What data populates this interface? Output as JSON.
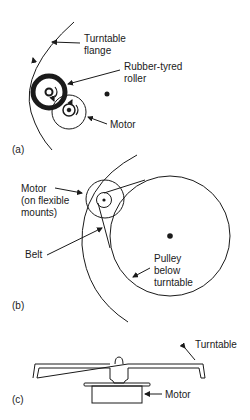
{
  "panels": {
    "a": {
      "tag": "(a)",
      "labels": {
        "flange_line1": "Turntable",
        "flange_line2": "flange",
        "roller_line1": "Rubber-tyred",
        "roller_line2": "roller",
        "motor": "Motor"
      }
    },
    "b": {
      "tag": "(b)",
      "labels": {
        "motor_line1": "Motor",
        "motor_line2": "(on flexible",
        "motor_line3": "mounts)",
        "belt": "Belt",
        "pulley_line1": "Pulley",
        "pulley_line2": "below",
        "pulley_line3": "turntable"
      }
    },
    "c": {
      "tag": "(c)",
      "labels": {
        "turntable": "Turntable",
        "motor": "Motor"
      }
    }
  },
  "colors": {
    "ink": "#1a1a1a",
    "background": "#ffffff"
  }
}
